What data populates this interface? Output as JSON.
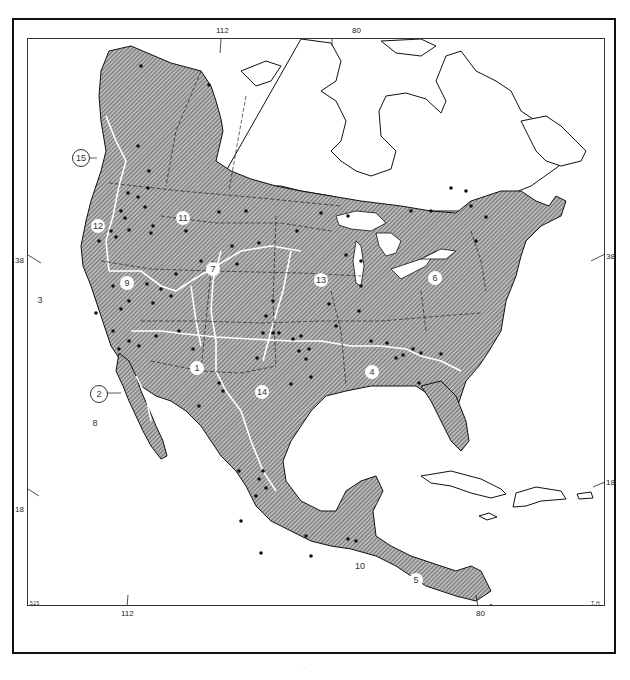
{
  "map": {
    "type": "range map",
    "region": "North America and Central America",
    "colors": {
      "range_fill": "#9a9a9a",
      "hatch": "#555555",
      "land_outline": "#111111",
      "background": "#ffffff",
      "subregion_line": "#ffffff",
      "locality_dot": "#111111"
    },
    "graticule": {
      "longitude_top": [
        "112",
        "80"
      ],
      "longitude_bottom": [
        "112",
        "80"
      ],
      "latitude_left": [
        "38",
        "18"
      ],
      "latitude_right": [
        "38",
        "18"
      ]
    },
    "regions": [
      {
        "id": "1",
        "label": "1"
      },
      {
        "id": "2",
        "label": "2"
      },
      {
        "id": "3",
        "label": "3"
      },
      {
        "id": "4",
        "label": "4"
      },
      {
        "id": "5",
        "label": "5"
      },
      {
        "id": "6",
        "label": "6"
      },
      {
        "id": "7",
        "label": "7"
      },
      {
        "id": "8",
        "label": "8"
      },
      {
        "id": "9",
        "label": "9"
      },
      {
        "id": "10",
        "label": "10"
      },
      {
        "id": "11",
        "label": "11"
      },
      {
        "id": "12",
        "label": "12"
      },
      {
        "id": "13",
        "label": "13"
      },
      {
        "id": "14",
        "label": "14"
      },
      {
        "id": "15",
        "label": "15"
      }
    ],
    "scale_bar": {
      "start": "0",
      "end": "600",
      "caption": "scale of miles"
    },
    "corner_marks": {
      "bottom_left": "525",
      "bottom_right": "T.H"
    },
    "footer": "· ·"
  }
}
